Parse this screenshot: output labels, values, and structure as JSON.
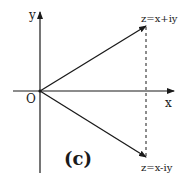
{
  "figure": {
    "caption": "(c)",
    "origin_label": "O",
    "x_axis_label": "x",
    "y_axis_label": "y",
    "points": [
      {
        "label": "z=x+iy",
        "position": "upper"
      },
      {
        "label": "z=x-iy",
        "position": "lower"
      }
    ],
    "colors": {
      "line": "#1a1a1a",
      "background": "#ffffff"
    }
  }
}
